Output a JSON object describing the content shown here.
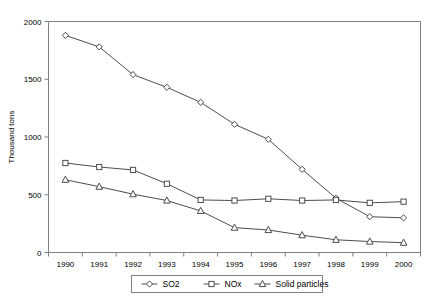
{
  "chart_data": {
    "type": "line",
    "title": "",
    "xlabel": "",
    "ylabel": "Thousand tons",
    "categories": [
      "1990",
      "1991",
      "1992",
      "1993",
      "1994",
      "1995",
      "1996",
      "1997",
      "1998",
      "1999",
      "2000"
    ],
    "x": [
      1990,
      1991,
      1992,
      1993,
      1994,
      1995,
      1996,
      1997,
      1998,
      1999,
      2000
    ],
    "ylim": [
      0,
      2000
    ],
    "yticks": [
      0,
      500,
      1000,
      1500,
      2000
    ],
    "ytick_labels": [
      "0",
      "500",
      "1000",
      "1500",
      "2000"
    ],
    "grid": false,
    "legend_position": "bottom",
    "series": [
      {
        "name": "SO2",
        "marker": "diamond",
        "values": [
          1880,
          1780,
          1540,
          1430,
          1300,
          1110,
          980,
          720,
          470,
          310,
          300
        ]
      },
      {
        "name": "NOx",
        "marker": "square",
        "values": [
          775,
          740,
          715,
          595,
          455,
          450,
          465,
          450,
          455,
          430,
          440
        ]
      },
      {
        "name": "Solid particles",
        "marker": "triangle",
        "values": [
          630,
          570,
          505,
          450,
          360,
          215,
          195,
          150,
          110,
          95,
          85
        ]
      }
    ],
    "colors": {
      "line": "#4d4d4d",
      "axis": "#808080",
      "text": "#000000",
      "background": "#ffffff"
    }
  },
  "legend": {
    "items": [
      {
        "label": "SO2"
      },
      {
        "label": "NOx"
      },
      {
        "label": "Solid particles"
      }
    ]
  },
  "yaxis": {
    "title": "Thousand tons",
    "ticks": [
      "0",
      "500",
      "1000",
      "1500",
      "2000"
    ]
  },
  "xaxis": {
    "ticks": [
      "1990",
      "1991",
      "1992",
      "1993",
      "1994",
      "1995",
      "1996",
      "1997",
      "1998",
      "1999",
      "2000"
    ]
  }
}
